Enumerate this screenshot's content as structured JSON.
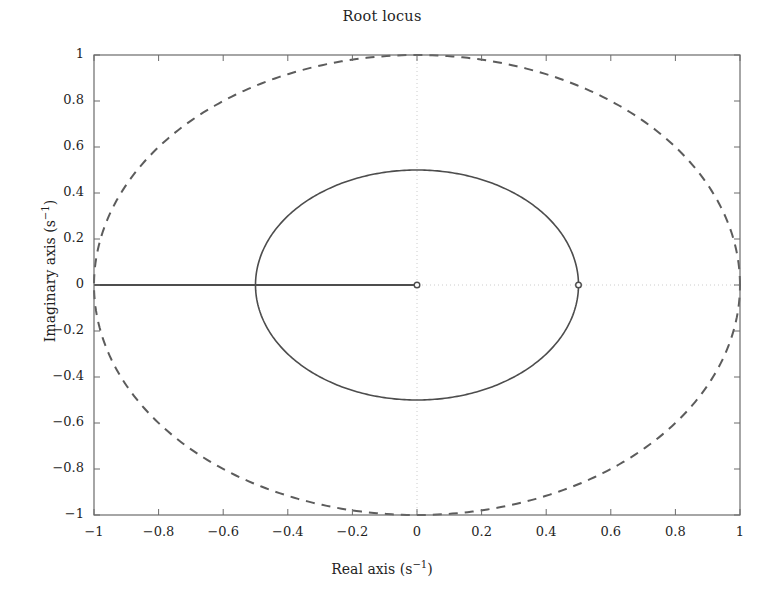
{
  "chart_data": {
    "type": "line",
    "title": "Root locus",
    "xlabel": "Real axis (s⁻¹)",
    "ylabel": "Imaginary axis (s⁻¹)",
    "xlabel_parts": {
      "text": "Real axis (s",
      "sup": "−1",
      "tail": ")"
    },
    "ylabel_parts": {
      "text": "Imaginary axis (s",
      "sup": "−1",
      "tail": ")"
    },
    "xlim": [
      -1,
      1
    ],
    "ylim": [
      -1,
      1
    ],
    "xticks": [
      -1,
      -0.8,
      -0.6,
      -0.4,
      -0.2,
      0,
      0.2,
      0.4,
      0.6,
      0.8,
      1
    ],
    "yticks": [
      -1,
      -0.8,
      -0.6,
      -0.4,
      -0.2,
      0,
      0.2,
      0.4,
      0.6,
      0.8,
      1
    ],
    "xticklabels": [
      "−1",
      "−0.8",
      "−0.6",
      "−0.4",
      "−0.2",
      "0",
      "0.2",
      "0.4",
      "0.6",
      "0.8",
      "1"
    ],
    "yticklabels": [
      "−1",
      "−0.8",
      "−0.6",
      "−0.4",
      "−0.2",
      "0",
      "0.2",
      "0.4",
      "0.6",
      "0.8",
      "1"
    ],
    "grid": "dotted-at-zero-axes",
    "legend": null,
    "series": [
      {
        "name": "outer-locus-branch",
        "style": "dashed",
        "color": "#5c5c5c",
        "shape": "circle",
        "center": [
          0,
          0
        ],
        "radius": 1.0,
        "note": "Dashed circular locus of radius 1 centred on the origin, passing through (−1,0), (0,1), (1,0) and (0,−1)."
      },
      {
        "name": "inner-locus-branch",
        "style": "solid",
        "color": "#4d4d4d",
        "shape": "circle",
        "center": [
          0,
          0
        ],
        "radius": 0.5,
        "note": "Solid circular locus of radius 0.5 centred on the origin, passing through (−0.5,0), (0,0.5), (0.5,0) and (0,−0.5)."
      },
      {
        "name": "real-axis-branch",
        "style": "solid",
        "color": "#4d4d4d",
        "shape": "segment",
        "points": [
          [
            -1,
            0
          ],
          [
            0,
            0
          ]
        ],
        "note": "Solid locus segment running along the real axis from −1 to the origin."
      }
    ],
    "markers": [
      {
        "name": "origin-marker",
        "x": 0,
        "y": 0,
        "symbol": "open-circle",
        "color": "#4d4d4d"
      },
      {
        "name": "right-branch-marker",
        "x": 0.5,
        "y": 0,
        "symbol": "open-circle",
        "color": "#4d4d4d"
      }
    ],
    "colors": {
      "background": "#ffffff",
      "axis": "#6b6b6b",
      "text": "#1f1f1f",
      "solid_curve": "#4d4d4d",
      "dashed_curve": "#5c5c5c",
      "gridline": "#cccccc"
    }
  }
}
